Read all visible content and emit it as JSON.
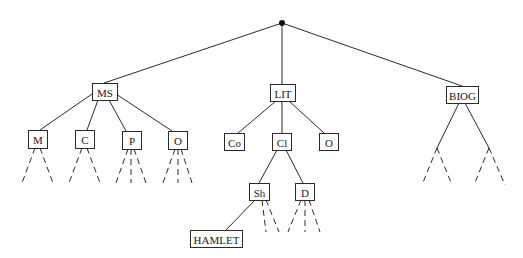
{
  "diagram": {
    "type": "tree",
    "root": {
      "id": "root",
      "x": 282,
      "y": 23
    },
    "nodes": [
      {
        "id": "MS",
        "label": "MS",
        "x": 92,
        "y": 83,
        "w": 25,
        "h": 17
      },
      {
        "id": "LIT",
        "label": "LIT",
        "x": 270,
        "y": 84,
        "w": 25,
        "h": 17
      },
      {
        "id": "BIOG",
        "label": "BIOG",
        "x": 446,
        "y": 86,
        "w": 32,
        "h": 17
      },
      {
        "id": "M",
        "label": "M",
        "x": 28,
        "y": 130,
        "w": 19,
        "h": 18
      },
      {
        "id": "C",
        "label": "C",
        "x": 75,
        "y": 130,
        "w": 19,
        "h": 18
      },
      {
        "id": "P",
        "label": "P",
        "x": 122,
        "y": 131,
        "w": 19,
        "h": 18
      },
      {
        "id": "O1",
        "label": "O",
        "x": 168,
        "y": 131,
        "w": 19,
        "h": 18
      },
      {
        "id": "Co",
        "label": "Co",
        "x": 224,
        "y": 133,
        "w": 20,
        "h": 17
      },
      {
        "id": "Cl",
        "label": "Cl",
        "x": 272,
        "y": 133,
        "w": 19,
        "h": 17
      },
      {
        "id": "O2",
        "label": "O",
        "x": 319,
        "y": 133,
        "w": 19,
        "h": 17
      },
      {
        "id": "Sh",
        "label": "Sh",
        "x": 249,
        "y": 183,
        "w": 20,
        "h": 17
      },
      {
        "id": "D",
        "label": "D",
        "x": 295,
        "y": 183,
        "w": 19,
        "h": 17
      },
      {
        "id": "HAMLET",
        "label": "HAMLET",
        "x": 190,
        "y": 230,
        "w": 52,
        "h": 17
      }
    ],
    "edges": [
      {
        "x1": 282,
        "y1": 23,
        "x2": 104,
        "y2": 83
      },
      {
        "x1": 282,
        "y1": 23,
        "x2": 282,
        "y2": 84
      },
      {
        "x1": 282,
        "y1": 23,
        "x2": 462,
        "y2": 86
      },
      {
        "x1": 92,
        "y1": 94,
        "x2": 40,
        "y2": 130
      },
      {
        "x1": 98,
        "y1": 100,
        "x2": 87,
        "y2": 130
      },
      {
        "x1": 109,
        "y1": 100,
        "x2": 126,
        "y2": 131
      },
      {
        "x1": 116,
        "y1": 94,
        "x2": 172,
        "y2": 131
      },
      {
        "x1": 276,
        "y1": 101,
        "x2": 238,
        "y2": 133
      },
      {
        "x1": 282,
        "y1": 101,
        "x2": 282,
        "y2": 133
      },
      {
        "x1": 289,
        "y1": 101,
        "x2": 324,
        "y2": 133
      },
      {
        "x1": 277,
        "y1": 150,
        "x2": 259,
        "y2": 183
      },
      {
        "x1": 286,
        "y1": 150,
        "x2": 303,
        "y2": 183
      },
      {
        "x1": 255,
        "y1": 200,
        "x2": 226,
        "y2": 230
      },
      {
        "x1": 459,
        "y1": 103,
        "x2": 437,
        "y2": 148
      },
      {
        "x1": 465,
        "y1": 103,
        "x2": 489,
        "y2": 148
      }
    ],
    "dashed_edges": [
      {
        "x1": 35,
        "y1": 148,
        "x2": 22,
        "y2": 183
      },
      {
        "x1": 40,
        "y1": 148,
        "x2": 53,
        "y2": 183
      },
      {
        "x1": 82,
        "y1": 148,
        "x2": 69,
        "y2": 183
      },
      {
        "x1": 87,
        "y1": 148,
        "x2": 100,
        "y2": 183
      },
      {
        "x1": 128,
        "y1": 149,
        "x2": 116,
        "y2": 183
      },
      {
        "x1": 131,
        "y1": 149,
        "x2": 131,
        "y2": 183
      },
      {
        "x1": 134,
        "y1": 149,
        "x2": 146,
        "y2": 183
      },
      {
        "x1": 175,
        "y1": 149,
        "x2": 163,
        "y2": 183
      },
      {
        "x1": 178,
        "y1": 149,
        "x2": 178,
        "y2": 183
      },
      {
        "x1": 181,
        "y1": 149,
        "x2": 192,
        "y2": 183
      },
      {
        "x1": 262,
        "y1": 200,
        "x2": 266,
        "y2": 232
      },
      {
        "x1": 266,
        "y1": 200,
        "x2": 279,
        "y2": 232
      },
      {
        "x1": 301,
        "y1": 200,
        "x2": 288,
        "y2": 232
      },
      {
        "x1": 305,
        "y1": 200,
        "x2": 305,
        "y2": 232
      },
      {
        "x1": 309,
        "y1": 200,
        "x2": 320,
        "y2": 232
      },
      {
        "x1": 437,
        "y1": 148,
        "x2": 422,
        "y2": 185
      },
      {
        "x1": 437,
        "y1": 148,
        "x2": 452,
        "y2": 185
      },
      {
        "x1": 489,
        "y1": 148,
        "x2": 474,
        "y2": 185
      },
      {
        "x1": 489,
        "y1": 148,
        "x2": 505,
        "y2": 185
      }
    ]
  }
}
